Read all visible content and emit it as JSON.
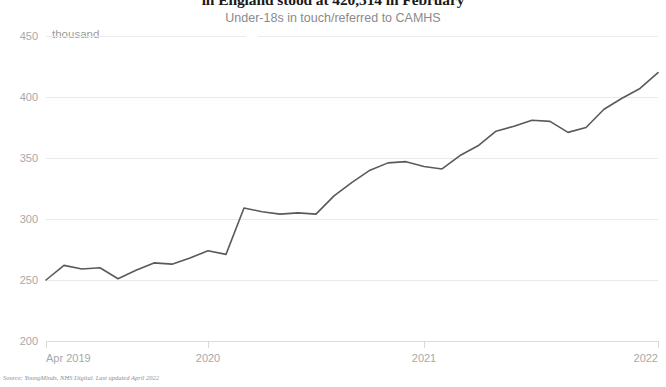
{
  "chart_data": {
    "type": "line",
    "title": "in England stood at 420,314 in February",
    "subtitle": "Under-18s in touch/referred to CAMHS",
    "unit_label": "thousand",
    "xlabel": "",
    "ylabel": "thousand",
    "ylim": [
      200,
      450
    ],
    "yticks": [
      200,
      250,
      300,
      350,
      400,
      450
    ],
    "grid": true,
    "legend": false,
    "line_color": "#5a5a5a",
    "x": [
      "Apr 2019",
      "May 2019",
      "Jun 2019",
      "Jul 2019",
      "Aug 2019",
      "Sep 2019",
      "Oct 2019",
      "Nov 2019",
      "Dec 2019",
      "Jan 2020",
      "Feb 2020",
      "Mar 2020",
      "Apr 2020",
      "May 2020",
      "Jun 2020",
      "Jul 2020",
      "Aug 2020",
      "Sep 2020",
      "Oct 2020",
      "Nov 2020",
      "Dec 2020",
      "Jan 2021",
      "Feb 2021",
      "Mar 2021",
      "Apr 2021",
      "May 2021",
      "Jun 2021",
      "Jul 2021",
      "Aug 2021",
      "Sep 2021",
      "Oct 2021",
      "Nov 2021",
      "Dec 2021",
      "Jan 2022",
      "Feb 2022"
    ],
    "xtick_labels": [
      "Apr 2019",
      "2020",
      "2021",
      "2022"
    ],
    "xtick_positions": [
      0,
      9,
      21,
      34
    ],
    "values": [
      250,
      262,
      259,
      260,
      251,
      258,
      264,
      263,
      268,
      274,
      271,
      309,
      306,
      304,
      305,
      304,
      319,
      330,
      340,
      346,
      347,
      343,
      341,
      352,
      360,
      372,
      376,
      381,
      380,
      371,
      375,
      390,
      399,
      407,
      420
    ],
    "source": "Source: YoungMinds, NHS Digital. Last updated April 2022"
  }
}
